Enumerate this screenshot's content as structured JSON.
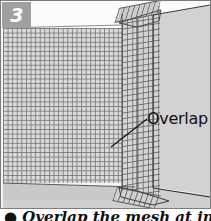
{
  "figure": {
    "step_number": "3",
    "callout": {
      "label": "Overlap"
    },
    "caption": "● Overlap the mesh at inside corners.",
    "colors": {
      "frame_border": "#7c7c7c",
      "step_chip_background": "#a0a0a0",
      "step_chip_text": "#ffffff",
      "wall_right": "#d2d2d2",
      "wall_right_shadow": "#bdbdbd",
      "floor": "#cfcfcf",
      "mesh_fill": "#d9d9d9",
      "mesh_wire": "#6e6e6e",
      "sky": "#fbfbfb",
      "line_ink": "#2b2b2b",
      "label_text": "#111111"
    },
    "geometry": {
      "frame_width": 211,
      "frame_height": 209,
      "mesh_cell_px": 4.6,
      "corner_x": 121,
      "leader_line_from": "110,145",
      "leader_line_to": "146,118"
    }
  }
}
